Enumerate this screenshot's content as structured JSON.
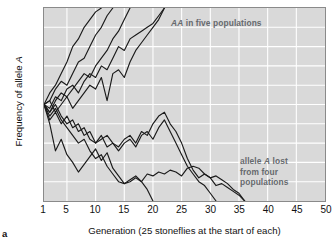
{
  "panel": {
    "letter": "a"
  },
  "chart_data": {
    "type": "line",
    "title": "",
    "xlabel": "Generation (25 stoneflies at the start of each)",
    "ylabel": "Frequency of allele A",
    "ylabel_italic_part": "A",
    "xlim": [
      1,
      50
    ],
    "ylim": [
      0,
      1
    ],
    "grid": true,
    "legend": "none",
    "xticks": [
      1,
      5,
      10,
      15,
      20,
      25,
      30,
      35,
      40,
      45,
      50
    ],
    "xtick_labels": [
      "1",
      "5",
      "10",
      "15",
      "20",
      "25",
      "30",
      "35",
      "40",
      "45",
      "50"
    ],
    "yticks": [
      0,
      0.5,
      1.0
    ],
    "ytick_labels": [
      "0",
      "0.5",
      "1.0"
    ],
    "x_gridlines": [
      5,
      10,
      15,
      20,
      25,
      30,
      35,
      40,
      45
    ],
    "y_gridlines": [
      0.1,
      0.2,
      0.3,
      0.4,
      0.5,
      0.6,
      0.7,
      0.8,
      0.9
    ],
    "background_color": "#d9d9d9",
    "gridline_color": "#ffffff",
    "line_color": "#1a1a1a",
    "annotations": [
      {
        "id": "fixed",
        "text_before": "",
        "italic": "AA",
        "text_after": " in five populations",
        "full_text": "AA in five populations",
        "x": 16,
        "y": 0.95
      },
      {
        "id": "lost",
        "lines": [
          "allele A lost",
          "from four",
          "populations"
        ],
        "full_text": "allele A lost from four populations",
        "italic": "A",
        "x": 33,
        "y": 0.25
      }
    ],
    "series": [
      {
        "name": "pop-1-fixed",
        "outcome": "A fixed",
        "x": [
          1,
          2,
          3,
          4,
          5,
          6,
          7,
          8,
          9,
          10,
          11
        ],
        "values": [
          0.5,
          0.56,
          0.6,
          0.66,
          0.72,
          0.8,
          0.84,
          0.9,
          0.94,
          0.98,
          1.0
        ]
      },
      {
        "name": "pop-2-fixed",
        "outcome": "A fixed",
        "x": [
          1,
          2,
          3,
          4,
          5,
          6,
          7,
          8,
          9,
          10,
          11,
          12,
          13
        ],
        "values": [
          0.5,
          0.52,
          0.58,
          0.62,
          0.6,
          0.66,
          0.72,
          0.74,
          0.8,
          0.86,
          0.9,
          0.96,
          1.0
        ]
      },
      {
        "name": "pop-3-fixed",
        "outcome": "A fixed",
        "x": [
          1,
          2,
          3,
          4,
          5,
          6,
          7,
          8,
          9,
          10,
          11,
          12,
          13,
          14,
          15,
          16
        ],
        "values": [
          0.5,
          0.46,
          0.52,
          0.56,
          0.54,
          0.58,
          0.62,
          0.66,
          0.64,
          0.7,
          0.74,
          0.78,
          0.84,
          0.88,
          0.94,
          1.0
        ]
      },
      {
        "name": "pop-4-fixed",
        "outcome": "A fixed",
        "x": [
          1,
          2,
          3,
          4,
          5,
          6,
          7,
          8,
          9,
          10,
          11,
          12,
          13,
          14,
          15,
          16,
          17,
          18,
          19,
          20,
          21,
          22
        ],
        "values": [
          0.5,
          0.48,
          0.54,
          0.52,
          0.58,
          0.6,
          0.56,
          0.62,
          0.66,
          0.64,
          0.7,
          0.68,
          0.74,
          0.8,
          0.78,
          0.84,
          0.86,
          0.88,
          0.9,
          0.92,
          0.96,
          1.0
        ]
      },
      {
        "name": "pop-5-fixed",
        "outcome": "A fixed",
        "x": [
          1,
          2,
          3,
          4,
          5,
          6,
          7,
          8,
          9,
          10,
          11,
          12,
          13,
          14,
          15,
          16,
          17,
          18,
          19,
          20,
          21,
          22
        ],
        "values": [
          0.5,
          0.52,
          0.46,
          0.5,
          0.54,
          0.48,
          0.52,
          0.56,
          0.6,
          0.58,
          0.64,
          0.52,
          0.66,
          0.68,
          0.64,
          0.72,
          0.78,
          0.82,
          0.86,
          0.9,
          0.94,
          1.0
        ]
      },
      {
        "name": "pop-6-lost",
        "outcome": "A lost",
        "x": [
          1,
          2,
          3,
          4,
          5,
          6,
          7,
          8,
          9,
          10,
          11,
          12,
          13,
          14,
          15,
          16,
          17,
          18,
          19,
          20
        ],
        "values": [
          0.5,
          0.44,
          0.48,
          0.42,
          0.38,
          0.34,
          0.3,
          0.32,
          0.26,
          0.22,
          0.24,
          0.18,
          0.14,
          0.1,
          0.09,
          0.11,
          0.13,
          0.1,
          0.06,
          0.0
        ]
      },
      {
        "name": "pop-7-lost",
        "outcome": "A lost",
        "x": [
          1,
          2,
          3,
          4,
          5,
          6,
          7,
          8,
          9,
          10,
          11,
          12,
          13,
          14,
          15,
          16,
          17,
          18,
          19,
          20,
          21,
          22,
          23,
          24,
          25,
          26,
          27,
          28,
          29,
          30,
          31
        ],
        "values": [
          0.5,
          0.46,
          0.5,
          0.44,
          0.4,
          0.42,
          0.36,
          0.38,
          0.32,
          0.3,
          0.34,
          0.28,
          0.3,
          0.26,
          0.3,
          0.32,
          0.28,
          0.34,
          0.36,
          0.32,
          0.38,
          0.42,
          0.36,
          0.3,
          0.24,
          0.18,
          0.14,
          0.1,
          0.08,
          0.04,
          0.0
        ]
      },
      {
        "name": "pop-8-lost",
        "outcome": "A lost",
        "x": [
          1,
          2,
          3,
          4,
          5,
          6,
          7,
          8,
          9,
          10,
          11,
          12,
          13,
          14,
          15,
          16,
          17,
          18,
          19,
          20,
          21,
          22,
          23,
          24,
          25,
          26,
          27,
          28,
          29,
          30,
          31,
          32,
          33,
          34,
          35,
          36
        ],
        "values": [
          0.5,
          0.42,
          0.46,
          0.4,
          0.44,
          0.38,
          0.4,
          0.34,
          0.36,
          0.3,
          0.32,
          0.34,
          0.3,
          0.28,
          0.32,
          0.34,
          0.3,
          0.36,
          0.34,
          0.4,
          0.44,
          0.46,
          0.4,
          0.36,
          0.3,
          0.22,
          0.16,
          0.12,
          0.14,
          0.12,
          0.08,
          0.09,
          0.07,
          0.05,
          0.03,
          0.0
        ]
      },
      {
        "name": "pop-9-lost",
        "outcome": "A lost",
        "x": [
          1,
          2,
          3,
          4,
          5,
          6,
          7,
          8,
          9,
          10,
          11,
          12,
          13,
          14,
          15,
          16,
          17,
          18,
          19,
          20,
          21,
          22,
          23,
          24,
          25,
          26,
          27,
          28,
          29,
          30,
          31,
          32,
          33,
          34,
          35,
          36
        ],
        "values": [
          0.5,
          0.4,
          0.26,
          0.32,
          0.24,
          0.2,
          0.15,
          0.19,
          0.23,
          0.27,
          0.21,
          0.25,
          0.17,
          0.13,
          0.09,
          0.1,
          0.12,
          0.1,
          0.14,
          0.13,
          0.15,
          0.14,
          0.16,
          0.15,
          0.13,
          0.17,
          0.18,
          0.17,
          0.14,
          0.12,
          0.13,
          0.11,
          0.09,
          0.06,
          0.04,
          0.0
        ]
      }
    ]
  }
}
